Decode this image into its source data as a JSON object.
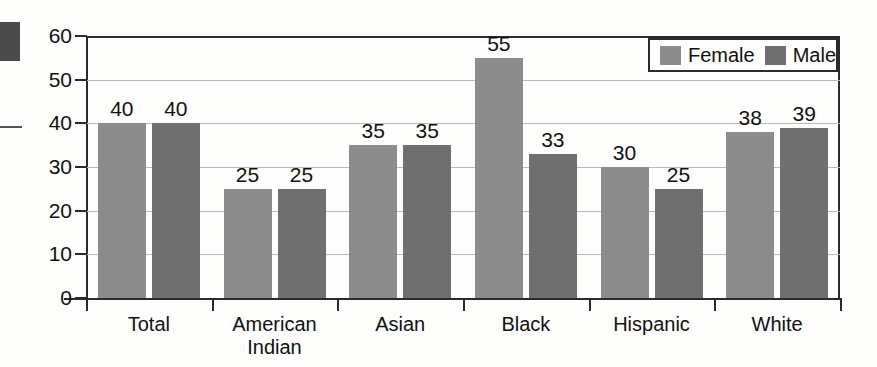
{
  "chart_data": {
    "type": "bar",
    "title": "",
    "xlabel": "",
    "ylabel": "",
    "ylim": [
      0,
      60
    ],
    "yticks": [
      0,
      10,
      20,
      30,
      40,
      50,
      60
    ],
    "grid": true,
    "legend_position": "top-right",
    "categories": [
      "Total",
      "American Indian",
      "Asian",
      "Black",
      "Hispanic",
      "White"
    ],
    "category_lines": [
      [
        "Total"
      ],
      [
        "American",
        "Indian"
      ],
      [
        "Asian"
      ],
      [
        "Black"
      ],
      [
        "Hispanic"
      ],
      [
        "White"
      ]
    ],
    "series": [
      {
        "name": "Female",
        "color": "#8c8c8c",
        "values": [
          40,
          25,
          35,
          55,
          30,
          38
        ]
      },
      {
        "name": "Male",
        "color": "#6f6f6f",
        "values": [
          40,
          25,
          35,
          33,
          25,
          39
        ]
      }
    ]
  },
  "legend": {
    "entries": [
      {
        "label": "Female"
      },
      {
        "label": "Male"
      }
    ]
  }
}
